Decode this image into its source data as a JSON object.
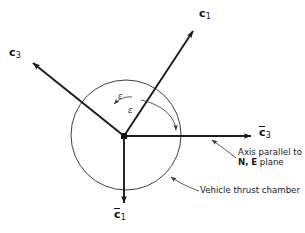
{
  "figure": {
    "background_color": "#ffffff",
    "line_color": "#1a1a1a",
    "thin_line_color": "#3a3a3a"
  },
  "axes": [
    {
      "id": "c1",
      "name": "c-one-axis",
      "label_base": "c",
      "label_sub": "1",
      "overbar": false,
      "from": [
        124,
        136
      ],
      "to": [
        196,
        26
      ],
      "description": "Thrust axis pointing upper right"
    },
    {
      "id": "c3",
      "name": "c-three-axis",
      "label_base": "c",
      "label_sub": "3",
      "overbar": false,
      "from": [
        124,
        136
      ],
      "to": [
        29,
        60
      ],
      "description": "Axis pointing upper left"
    },
    {
      "id": "cbar3",
      "name": "c-bar-three-axis",
      "label_base": "c",
      "label_sub": "3",
      "overbar": true,
      "from": [
        124,
        136
      ],
      "to": [
        256,
        136
      ],
      "description": "Horizontal reference axis pointing right"
    },
    {
      "id": "cbar1",
      "name": "c-bar-one-axis",
      "label_base": "c",
      "label_sub": "1",
      "overbar": true,
      "from": [
        124,
        136
      ],
      "to": [
        124,
        208
      ],
      "description": "Vertical reference axis pointing down"
    }
  ],
  "chamber_circle": {
    "name": "vehicle-thrust-chamber-circle",
    "center": [
      126,
      135
    ],
    "radius": 55
  },
  "origin": {
    "name": "origin-point",
    "position": [
      124,
      136
    ]
  },
  "angle_arcs": [
    {
      "id": "eps-upper",
      "name": "epsilon-angle-arc-upper",
      "label": "ε",
      "description": "Small arc between c3 axis and c1 axis"
    },
    {
      "id": "eps-lower",
      "name": "epsilon-angle-arc-lower",
      "label": "ε",
      "description": "Large arc between c1 axis and c-bar-3 horizontal axis"
    }
  ],
  "annotations": [
    {
      "id": "axis-plane",
      "name": "annotation-axis-parallel-to-plane",
      "line1": "Axis parallel to",
      "bold_n": "N",
      "comma": ",",
      "bold_e": "E",
      "line2_tail": "plane",
      "leader_from": [
        235,
        157
      ],
      "leader_to": [
        209,
        138
      ]
    },
    {
      "id": "chamber",
      "name": "annotation-vehicle-thrust-chamber",
      "text": "Vehicle thrust chamber",
      "leader_from": [
        198,
        191
      ],
      "leader_to": [
        167,
        175
      ]
    }
  ]
}
